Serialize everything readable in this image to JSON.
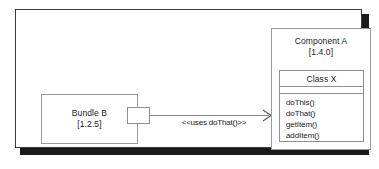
{
  "diagram": {
    "type": "uml-component-diagram",
    "frame": {
      "name": "system-frame"
    },
    "bundle": {
      "name": "Bundle B",
      "version": "[1.2.5]",
      "port_name": "required-interface-port"
    },
    "dependency": {
      "stereotype": "<<uses doThat()>>",
      "arrow_name": "dependency-arrowhead",
      "direction": "right"
    },
    "component": {
      "name": "Component A",
      "version": "[1.4.0]",
      "class": {
        "name": "Class X",
        "attributes": [],
        "operations": [
          "doThis()",
          "doThat()",
          "getItem()",
          "addItem()"
        ]
      }
    },
    "colors": {
      "frame_border": "#3a3a3a",
      "frame_shadow": "#1a1a1a",
      "box_border": "#9a9a9a",
      "inner_border": "#8f8f8f",
      "connector": "#8d8d8d",
      "text": "#1b1b1b",
      "background": "#ffffff"
    }
  }
}
